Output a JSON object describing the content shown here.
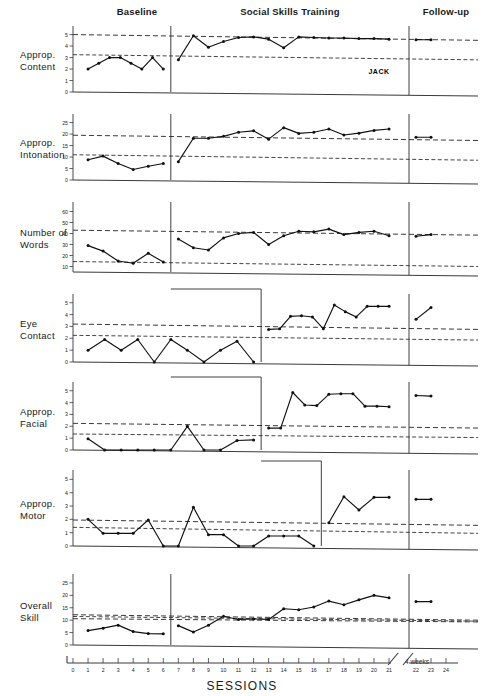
{
  "figure": {
    "subject_label": "JACK",
    "x_axis_title": "SESSIONS",
    "break_label": "4 weeks",
    "phases": [
      {
        "name": "baseline",
        "label": "Baseline"
      },
      {
        "name": "training",
        "label": "Social Skills Training"
      },
      {
        "name": "followup",
        "label": "Follow-up"
      }
    ],
    "x_ticks": [
      "0",
      "1",
      "2",
      "3",
      "4",
      "5",
      "6",
      "7",
      "8",
      "9",
      "10",
      "11",
      "12",
      "13",
      "14",
      "15",
      "16",
      "17",
      "18",
      "19",
      "20",
      "21"
    ],
    "x_ticks_followup": [
      "22",
      "23",
      "24"
    ]
  },
  "chart_data": {
    "type": "line",
    "title": "JACK",
    "xlabel": "SESSIONS",
    "layout": "multiple-baseline across behaviors, 7 stacked panels, shared x axis",
    "grid": false,
    "legend": "none",
    "x": [
      1,
      2,
      3,
      4,
      5,
      6,
      7,
      8,
      9,
      10,
      11,
      12,
      13,
      14,
      15,
      16,
      17,
      18,
      19,
      20,
      21,
      22,
      23,
      24
    ],
    "panels": [
      {
        "name": "approp-content",
        "ylabel": "Approp. Content",
        "yticks": [
          0,
          1,
          2,
          3,
          4,
          5
        ],
        "ylim": [
          0,
          5.4
        ],
        "intervention_start_session": 7,
        "reference_lines": [
          {
            "from": 5.0,
            "to": 4.5
          },
          {
            "from": 3.25,
            "to": 2.8
          }
        ],
        "segments": [
          {
            "phase": "baseline",
            "x": [
              1,
              2,
              3,
              4,
              5,
              6
            ],
            "y": [
              2.0,
              2.5,
              3.0,
              3.0,
              2.5,
              2.0,
              3.0,
              2.0
            ]
          },
          {
            "phase": "training",
            "x": [
              7,
              8,
              9,
              10,
              11,
              12,
              13,
              14,
              15,
              16,
              17,
              18,
              19,
              20,
              21
            ],
            "y": [
              2.8,
              4.9,
              3.9,
              4.4,
              4.75,
              4.8,
              4.6,
              3.85,
              4.8,
              4.75,
              4.7,
              4.7,
              4.65,
              4.65,
              4.6
            ]
          },
          {
            "phase": "followup",
            "x": [
              22,
              23
            ],
            "y": [
              4.55,
              4.55
            ]
          }
        ]
      },
      {
        "name": "approp-intonation",
        "ylabel": "Approp. Intonation",
        "yticks": [
          0,
          5,
          10,
          15,
          20,
          25
        ],
        "ylim": [
          0,
          27
        ],
        "intervention_start_session": 7,
        "reference_lines": [
          {
            "from": 19.5,
            "to": 17.2
          },
          {
            "from": 11.0,
            "to": 8.6
          }
        ],
        "segments": [
          {
            "phase": "baseline",
            "x": [
              1,
              2,
              3,
              4,
              5,
              6
            ],
            "y": [
              8.8,
              10.4,
              7.2,
              4.6,
              6.0,
              7.2
            ]
          },
          {
            "phase": "training",
            "x": [
              7,
              8,
              9,
              10,
              11,
              12,
              13,
              14,
              15,
              16,
              17,
              18,
              19,
              20,
              21
            ],
            "y": [
              8.0,
              18.2,
              18.2,
              19.0,
              20.8,
              21.4,
              17.8,
              22.8,
              20.3,
              20.8,
              22.2,
              19.6,
              20.4,
              21.6,
              22.2
            ]
          },
          {
            "phase": "followup",
            "x": [
              22,
              23
            ],
            "y": [
              18.6,
              18.6
            ]
          }
        ]
      },
      {
        "name": "number-of-words",
        "ylabel": "Number of Words",
        "yticks": [
          10,
          20,
          30,
          40,
          50,
          60
        ],
        "ylim": [
          5,
          65
        ],
        "intervention_start_session": 7,
        "reference_lines": [
          {
            "from": 43.0,
            "to": 38.5
          },
          {
            "from": 14.5,
            "to": 10.0
          }
        ],
        "segments": [
          {
            "phase": "baseline",
            "x": [
              1,
              2,
              3,
              4,
              5,
              6
            ],
            "y": [
              29.0,
              24.0,
              15.0,
              13.0,
              22.0,
              14.0
            ]
          },
          {
            "phase": "training",
            "x": [
              7,
              8,
              9,
              10,
              11,
              12,
              13,
              14,
              15,
              16,
              17,
              18,
              19,
              20,
              21
            ],
            "y": [
              35.0,
              27.0,
              25.0,
              36.0,
              40.0,
              41.0,
              30.0,
              38.0,
              42.0,
              41.5,
              44.0,
              39.0,
              41.0,
              42.0,
              38.0
            ]
          },
          {
            "phase": "followup",
            "x": [
              22,
              23
            ],
            "y": [
              37.5,
              39.0
            ]
          }
        ]
      },
      {
        "name": "eye-contact",
        "ylabel": "Eye Contact",
        "yticks": [
          0,
          1,
          2,
          3,
          4,
          5
        ],
        "ylim": [
          0,
          5.4
        ],
        "intervention_start_session": 13,
        "reference_lines": [
          {
            "from": 3.2,
            "to": 2.75
          },
          {
            "from": 2.25,
            "to": 1.85
          }
        ],
        "segments": [
          {
            "phase": "baseline",
            "x": [
              1,
              2,
              3,
              4,
              5,
              6,
              7,
              8,
              9,
              10,
              11,
              12
            ],
            "y": [
              1.0,
              1.9,
              1.0,
              1.9,
              0.0,
              1.9,
              1.0,
              0.0,
              1.0,
              1.75,
              0.0
            ]
          },
          {
            "phase": "training",
            "x": [
              13,
              14,
              15,
              16,
              17,
              18,
              19,
              20,
              21
            ],
            "y": [
              2.75,
              2.8,
              3.85,
              3.9,
              3.8,
              2.8,
              4.8,
              4.25,
              3.8,
              4.7,
              4.7,
              4.7
            ]
          },
          {
            "phase": "followup",
            "x": [
              22,
              23
            ],
            "y": [
              3.6,
              4.6
            ]
          }
        ]
      },
      {
        "name": "approp-facial",
        "ylabel": "Approp. Facial",
        "yticks": [
          0,
          1,
          2,
          3,
          4,
          5
        ],
        "ylim": [
          0,
          5.4
        ],
        "intervention_start_session": 13,
        "reference_lines": [
          {
            "from": 2.25,
            "to": 1.85
          },
          {
            "from": 1.35,
            "to": 1.05
          }
        ],
        "segments": [
          {
            "phase": "baseline",
            "x": [
              1,
              2,
              3,
              4,
              5,
              6,
              7,
              8,
              9,
              10,
              11,
              12
            ],
            "y": [
              0.95,
              0.0,
              0.0,
              0.0,
              0.0,
              0.0,
              2.0,
              0.0,
              0.0,
              0.8,
              0.85
            ]
          },
          {
            "phase": "training",
            "x": [
              13,
              14,
              15,
              16,
              17,
              18,
              19,
              20,
              21
            ],
            "y": [
              1.85,
              1.85,
              4.85,
              3.8,
              3.75,
              4.7,
              4.75,
              4.75,
              3.7,
              3.7,
              3.65
            ]
          },
          {
            "phase": "followup",
            "x": [
              22,
              23
            ],
            "y": [
              4.6,
              4.55
            ]
          }
        ]
      },
      {
        "name": "approp-motor",
        "ylabel": "Approp. Motor",
        "yticks": [
          0,
          1,
          2,
          3,
          4,
          5
        ],
        "ylim": [
          0,
          5.4
        ],
        "intervention_start_session": 17,
        "reference_lines": [
          {
            "from": 1.95,
            "to": 1.55
          },
          {
            "from": 1.4,
            "to": 0.95
          }
        ],
        "segments": [
          {
            "phase": "baseline",
            "x": [
              1,
              2,
              3,
              4,
              5,
              6,
              7,
              8,
              9,
              10,
              11,
              12,
              13,
              14,
              15,
              16
            ],
            "y": [
              2.0,
              0.95,
              0.95,
              0.95,
              1.95,
              0.0,
              0.0,
              2.9,
              0.85,
              0.85,
              0.0,
              0.0,
              0.75,
              0.75,
              0.75,
              0.0
            ]
          },
          {
            "phase": "training",
            "x": [
              17,
              18,
              19,
              20,
              21
            ],
            "y": [
              1.75,
              3.7,
              2.7,
              3.65,
              3.65
            ]
          },
          {
            "phase": "followup",
            "x": [
              22,
              23
            ],
            "y": [
              3.5,
              3.5
            ]
          }
        ]
      },
      {
        "name": "overall-skill",
        "ylabel": "Overall Skill",
        "yticks": [
          0,
          5,
          10,
          15,
          20,
          25
        ],
        "ylim": [
          0,
          27
        ],
        "intervention_start_session": 7,
        "reference_lines": [
          {
            "from": 12.2,
            "to": 10.0
          },
          {
            "from": 11.5,
            "to": 9.6
          },
          {
            "from": 10.6,
            "to": 9.3
          }
        ],
        "segments": [
          {
            "phase": "baseline",
            "x": [
              1,
              2,
              3,
              4,
              5,
              6
            ],
            "y": [
              5.8,
              6.8,
              8.0,
              5.4,
              4.6,
              4.5
            ]
          },
          {
            "phase": "training",
            "x": [
              7,
              8,
              9,
              10,
              11,
              12,
              13,
              14,
              15,
              16,
              17,
              18,
              19,
              20,
              21
            ],
            "y": [
              7.8,
              5.2,
              8.0,
              11.6,
              10.3,
              10.5,
              10.3,
              14.6,
              14.2,
              15.3,
              17.7,
              16.2,
              18.2,
              20.0,
              19.0
            ]
          },
          {
            "phase": "followup",
            "x": [
              22,
              23
            ],
            "y": [
              17.5,
              17.5
            ]
          }
        ]
      }
    ]
  }
}
